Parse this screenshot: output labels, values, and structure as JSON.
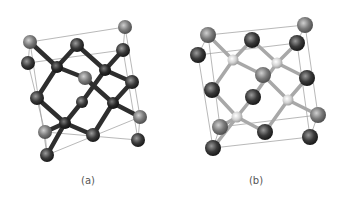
{
  "figure": {
    "panels": [
      {
        "id": "a",
        "caption": "(a)",
        "caption_pos": [
          88,
          175
        ],
        "bond_color": "#2e2e2e",
        "bond_width": 4.5,
        "box": {
          "front": [
            [
              30,
              42
            ],
            [
              125,
              27
            ],
            [
              140,
              117
            ],
            [
              47,
              155
            ]
          ],
          "back": [
            [
              28,
              63
            ],
            [
              123,
              50
            ],
            [
              138,
              140
            ],
            [
              45,
              132
            ]
          ]
        },
        "atoms": [
          {
            "x": 125,
            "y": 27,
            "r": 7,
            "kind": "gray"
          },
          {
            "x": 30,
            "y": 42,
            "r": 7,
            "kind": "gray"
          },
          {
            "x": 77,
            "y": 45,
            "r": 7,
            "kind": "dark"
          },
          {
            "x": 123,
            "y": 50,
            "r": 7,
            "kind": "dark"
          },
          {
            "x": 28,
            "y": 63,
            "r": 7,
            "kind": "dark"
          },
          {
            "x": 57,
            "y": 67,
            "r": 6,
            "kind": "node"
          },
          {
            "x": 105,
            "y": 70,
            "r": 6,
            "kind": "node"
          },
          {
            "x": 85,
            "y": 78,
            "r": 7,
            "kind": "gray"
          },
          {
            "x": 132,
            "y": 82,
            "r": 7,
            "kind": "dark"
          },
          {
            "x": 37,
            "y": 98,
            "r": 7,
            "kind": "dark"
          },
          {
            "x": 82,
            "y": 102,
            "r": 6,
            "kind": "dark"
          },
          {
            "x": 113,
            "y": 103,
            "r": 6,
            "kind": "node"
          },
          {
            "x": 140,
            "y": 117,
            "r": 7,
            "kind": "gray"
          },
          {
            "x": 65,
            "y": 123,
            "r": 6,
            "kind": "node"
          },
          {
            "x": 45,
            "y": 132,
            "r": 7,
            "kind": "gray"
          },
          {
            "x": 93,
            "y": 135,
            "r": 7,
            "kind": "dark"
          },
          {
            "x": 138,
            "y": 140,
            "r": 7,
            "kind": "dark"
          },
          {
            "x": 47,
            "y": 155,
            "r": 7,
            "kind": "dark"
          }
        ],
        "bonds": [
          [
            30,
            42,
            57,
            67
          ],
          [
            77,
            45,
            57,
            67
          ],
          [
            85,
            78,
            57,
            67
          ],
          [
            37,
            98,
            57,
            67
          ],
          [
            77,
            45,
            105,
            70
          ],
          [
            123,
            50,
            105,
            70
          ],
          [
            132,
            82,
            105,
            70
          ],
          [
            82,
            102,
            105,
            70
          ],
          [
            132,
            82,
            113,
            103
          ],
          [
            140,
            117,
            113,
            103
          ],
          [
            93,
            135,
            113,
            103
          ],
          [
            85,
            78,
            113,
            103
          ],
          [
            37,
            98,
            65,
            123
          ],
          [
            82,
            102,
            65,
            123
          ],
          [
            93,
            135,
            65,
            123
          ],
          [
            47,
            155,
            65,
            123
          ],
          [
            45,
            132,
            65,
            123
          ]
        ]
      },
      {
        "id": "b",
        "caption": "(b)",
        "caption_pos": [
          256,
          175
        ],
        "bond_color": "#a8a8a8",
        "bond_width": 3.5,
        "box": {
          "front": [
            [
              208,
              35
            ],
            [
              305,
              25
            ],
            [
              318,
              115
            ],
            [
              220,
              127
            ]
          ],
          "back": [
            [
              198,
              55
            ],
            [
              297,
              43
            ],
            [
              310,
              137
            ],
            [
              213,
              148
            ]
          ]
        },
        "atoms": [
          {
            "x": 305,
            "y": 25,
            "r": 8,
            "kind": "gray"
          },
          {
            "x": 208,
            "y": 35,
            "r": 8,
            "kind": "gray"
          },
          {
            "x": 252,
            "y": 40,
            "r": 8,
            "kind": "dark"
          },
          {
            "x": 297,
            "y": 43,
            "r": 8,
            "kind": "dark"
          },
          {
            "x": 198,
            "y": 55,
            "r": 8,
            "kind": "dark"
          },
          {
            "x": 233,
            "y": 60,
            "r": 5.5,
            "kind": "light"
          },
          {
            "x": 277,
            "y": 63,
            "r": 5.5,
            "kind": "light"
          },
          {
            "x": 263,
            "y": 75,
            "r": 8,
            "kind": "gray"
          },
          {
            "x": 307,
            "y": 78,
            "r": 8,
            "kind": "dark"
          },
          {
            "x": 212,
            "y": 90,
            "r": 8,
            "kind": "dark"
          },
          {
            "x": 253,
            "y": 97,
            "r": 8,
            "kind": "dark"
          },
          {
            "x": 288,
            "y": 100,
            "r": 5.5,
            "kind": "light"
          },
          {
            "x": 318,
            "y": 115,
            "r": 8,
            "kind": "gray"
          },
          {
            "x": 237,
            "y": 117,
            "r": 5.5,
            "kind": "light"
          },
          {
            "x": 220,
            "y": 127,
            "r": 8,
            "kind": "gray"
          },
          {
            "x": 265,
            "y": 132,
            "r": 8,
            "kind": "dark"
          },
          {
            "x": 310,
            "y": 137,
            "r": 8,
            "kind": "dark"
          },
          {
            "x": 213,
            "y": 148,
            "r": 8,
            "kind": "dark"
          }
        ],
        "bonds": [
          [
            208,
            35,
            233,
            60
          ],
          [
            252,
            40,
            233,
            60
          ],
          [
            263,
            75,
            233,
            60
          ],
          [
            212,
            90,
            233,
            60
          ],
          [
            252,
            40,
            277,
            63
          ],
          [
            297,
            43,
            277,
            63
          ],
          [
            307,
            78,
            277,
            63
          ],
          [
            253,
            97,
            277,
            63
          ],
          [
            307,
            78,
            288,
            100
          ],
          [
            318,
            115,
            288,
            100
          ],
          [
            265,
            132,
            288,
            100
          ],
          [
            263,
            75,
            288,
            100
          ],
          [
            212,
            90,
            237,
            117
          ],
          [
            253,
            97,
            237,
            117
          ],
          [
            265,
            132,
            237,
            117
          ],
          [
            213,
            148,
            237,
            117
          ],
          [
            220,
            127,
            237,
            117
          ]
        ]
      }
    ],
    "colors": {
      "box_line": "#9a9a9a",
      "gray_atom": [
        "#d0d0d0",
        "#7a7a7a",
        "#4a4a4a"
      ],
      "dark_atom": [
        "#9a9a9a",
        "#3a3a3a",
        "#151515"
      ],
      "node_atom": [
        "#7a7a7a",
        "#2a2a2a",
        "#101010"
      ],
      "light_atom": [
        "#ffffff",
        "#d4d4d4",
        "#9a9a9a"
      ]
    }
  }
}
